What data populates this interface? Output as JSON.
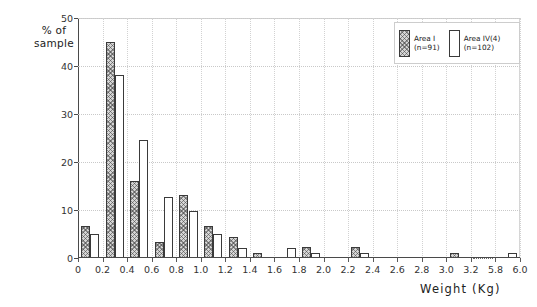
{
  "chart_data": {
    "type": "bar",
    "title": "",
    "subtitle": "",
    "xlabel": "Weight  (Kg)",
    "ylabel": "% of\nsample",
    "ylim": [
      0,
      50
    ],
    "yticks": [
      0,
      10,
      20,
      30,
      40,
      50
    ],
    "ytick_labels": [
      "0",
      "10",
      "20",
      "30",
      "40",
      "50"
    ],
    "xtick_labels": [
      "0",
      "0.2",
      "0.4",
      "0.6",
      "0.8",
      "1.0",
      "1.2",
      "1.4",
      "1.6",
      "1.8",
      "2.0",
      "2.2",
      "2.4",
      "2.6",
      "2.8",
      "3.0",
      "3.2",
      "5.8",
      "6.0"
    ],
    "axis_break_between": [
      "3.2",
      "5.8"
    ],
    "grid": "dotted-both-axes",
    "legend_position": "top-right",
    "bin_labels": [
      "0-0.2",
      "0.2-0.4",
      "0.4-0.6",
      "0.6-0.8",
      "0.8-1.0",
      "1.0-1.2",
      "1.2-1.4",
      "1.4-1.6",
      "1.6-1.8",
      "1.8-2.0",
      "2.0-2.2",
      "2.2-2.4",
      "2.4-2.6",
      "2.6-2.8",
      "2.8-3.0",
      "3.0-3.2",
      "5.8-6.0"
    ],
    "series": [
      {
        "name": "Area I",
        "legend_label": "Area I\n(n=91)",
        "sample_size": 91,
        "fill": "hatched",
        "values": [
          6.6,
          45.0,
          16.0,
          3.3,
          13.2,
          6.6,
          4.4,
          1.1,
          0.0,
          2.2,
          0.0,
          2.2,
          0.0,
          0.0,
          0.0,
          1.1,
          0.0
        ]
      },
      {
        "name": "Area IV(4)",
        "legend_label": "Area IV(4)\n(n=102)",
        "sample_size": 102,
        "fill": "white",
        "values": [
          4.9,
          38.2,
          24.5,
          12.7,
          9.8,
          4.9,
          2.0,
          0.0,
          2.0,
          1.0,
          0.0,
          1.0,
          0.0,
          0.0,
          0.0,
          0.0,
          1.0
        ]
      }
    ]
  },
  "legend": {
    "entry_a": "Area I\n(n=91)",
    "entry_b": "Area IV(4)\n(n=102)"
  },
  "axes": {
    "y_title": "% of\nsample",
    "x_title": "Weight  (Kg)"
  }
}
